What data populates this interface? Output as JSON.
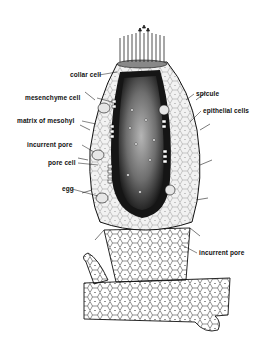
{
  "figure": {
    "colors": {
      "ink": "#111111",
      "background": "#ffffff",
      "cavity_dark": "#1a1a1a",
      "cavity_light": "#8a8a8a"
    }
  },
  "labels": {
    "collar_cell": "collar cell",
    "mesenchyme_cell": "mesenchyme cell",
    "matrix_of_mesohyl": "matrix of mesohyl",
    "incurrent_pore_left": "incurrent pore",
    "pore_cell": "pore cell",
    "egg": "egg",
    "spicule": "spicule",
    "epithelial_cells": "epithelial cells",
    "incurrent_pore_right": "incurrent pore"
  }
}
